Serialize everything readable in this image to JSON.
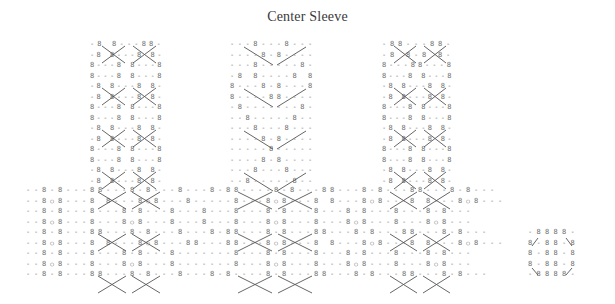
{
  "title": "Center Sleeve",
  "legend_symbols": {
    "B": "purl-stitch-symbol",
    "-": "knit-stitch-symbol",
    "o": "yarn-over-symbol",
    "/": "right-cross-diagonal",
    "\\": "left-cross-diagonal"
  },
  "grid": {
    "cell_w": 7.2,
    "row_h": 10.55,
    "origin_x": 26,
    "origin_y": 38
  },
  "panels": [
    {
      "name": "left-cable-panel",
      "col_start": 9,
      "row_start": 0,
      "rows": [
        "-B B---BB-",
        "-B B---B B-",
        "B---B B---B",
        "B---B B---B",
        "-B B---B B-",
        "-B B---B B-",
        "B---B B---B",
        "B---B B---B",
        "-B B---B B-",
        "-B B---B B-",
        "B---B B---B",
        "B---B B---B",
        "-B B---B B-",
        "-B B---B B-"
      ]
    },
    {
      "name": "center-heart-panel",
      "col_start": 28,
      "row_start": 0,
      "rows": [
        "---B---B---",
        "----B-B----",
        "---B-----B-",
        "-B B----B B",
        "B---B-B---B",
        "B----BB----",
        "-B-------B-",
        "--B-----B--",
        "---B---B---",
        "----B-B----",
        "-----B-----",
        "----B-B----",
        "---B---B---",
        "--B-----B--"
      ]
    },
    {
      "name": "right-cable-panel",
      "col_start": 50,
      "row_start": 0,
      "rows": [
        "-BB---BB-",
        "-B B-B B-",
        "B---BB---B",
        "B---B B---B",
        "-B B---B B-",
        "-B B---B B-",
        "B---B B---B",
        "B---B B---B",
        "-B B---B B-",
        "-B B---B B-",
        "B---B B---B",
        "B---B B---B",
        "-B B---B B-",
        "-B B---B B-"
      ]
    }
  ],
  "wide_rows": [
    "--B-B---BB---B-B---B---B-BB----B-B---BB---B-B---BB---B-B---",
    "--BoB---B B---BoB---B-----B---BoB---B B---BoB---B B---BoB---",
    "--B-B---B---B-B---B---B---B---B-B---B---B-B---B---B-B---",
    "--BoB---B---BoB---B---B---B---BoB---B---BoB---B---BoB---",
    "--B-B---BB---B-B---B---B-BB---B-B---BB---B-B---BB---B-B---",
    "--BoB---B B---BoB---BB---BB---BoB---B B---BoB---B B---BoB---",
    "--B-B---B---B-B---B-------B---B-B---B---B-B---B---B-B---",
    "--BoB---B---BoB---B-------B---BoB---B---BoB---B---BoB---",
    "--B-B---BB---B-B---B---B-B----B-B---BB---B-B---BB---B-B---"
  ],
  "small_motif": {
    "name": "bottom-right-motif",
    "rows": [
      "-BBBB-",
      "B-BB-B",
      "B-BB-B",
      "B-BB-B",
      "-BBBB-"
    ]
  }
}
